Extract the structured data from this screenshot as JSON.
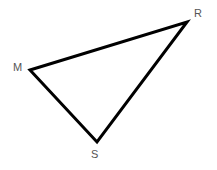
{
  "figure": {
    "name": "triangle-mrs",
    "type": "geometry-diagram",
    "background_color": "#ffffff",
    "canvas": {
      "width": 217,
      "height": 170
    },
    "stroke": {
      "color": "#000000",
      "width": 3,
      "linejoin": "miter",
      "linecap": "butt"
    },
    "label_color": "#555555",
    "label_font_size": 11,
    "vertices": [
      {
        "id": "M",
        "label": "M",
        "x": 30,
        "y": 70,
        "label_x": 13,
        "label_y": 62
      },
      {
        "id": "R",
        "label": "R",
        "x": 187,
        "y": 22,
        "label_x": 194,
        "label_y": 8
      },
      {
        "id": "S",
        "label": "S",
        "x": 97,
        "y": 142,
        "label_x": 91,
        "label_y": 149
      }
    ],
    "edges": [
      {
        "id": "MR",
        "from": "M",
        "to": "R"
      },
      {
        "id": "RS",
        "from": "R",
        "to": "S"
      },
      {
        "id": "SM",
        "from": "S",
        "to": "M"
      }
    ],
    "polygon_points": "30,70 187,22 97,142"
  }
}
